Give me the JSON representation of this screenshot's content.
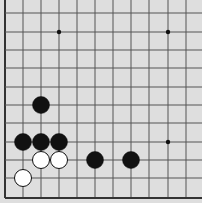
{
  "board": {
    "background": "#dedede",
    "line_color": "#555555",
    "edge_color": "#333333",
    "x_lines": [
      5,
      23,
      41,
      59,
      77,
      95,
      113,
      131,
      149,
      168,
      186
    ],
    "y_lines": [
      13,
      32,
      50,
      68,
      87,
      105,
      123,
      142,
      160,
      178,
      198
    ],
    "edges": [
      "left",
      "bottom"
    ],
    "star_points": [
      {
        "col": 3,
        "row": 1
      },
      {
        "col": 9,
        "row": 1
      },
      {
        "col": 9,
        "row": 7
      }
    ],
    "stones": [
      {
        "color": "black",
        "col": 2,
        "row": 5
      },
      {
        "color": "black",
        "col": 1,
        "row": 7
      },
      {
        "color": "black",
        "col": 2,
        "row": 7
      },
      {
        "color": "black",
        "col": 3,
        "row": 7
      },
      {
        "color": "white",
        "col": 2,
        "row": 8
      },
      {
        "color": "white",
        "col": 3,
        "row": 8
      },
      {
        "color": "black",
        "col": 5,
        "row": 8
      },
      {
        "color": "black",
        "col": 7,
        "row": 8
      },
      {
        "color": "white",
        "col": 1,
        "row": 9
      }
    ],
    "stone_radius": 8.5
  }
}
